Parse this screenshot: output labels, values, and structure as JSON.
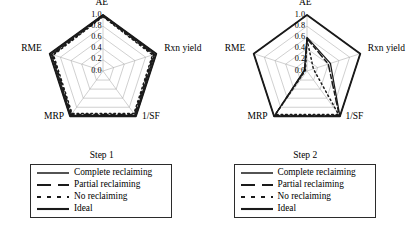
{
  "figure": {
    "panels": [
      {
        "title": "Step 1",
        "axes": [
          "AE",
          "Rxn yield",
          "1/SF",
          "MRP",
          "RME"
        ],
        "tick_labels": [
          "1.0",
          "0.8",
          "0.6",
          "0.4",
          "0.2",
          "0.0"
        ]
      },
      {
        "title": "Step 2",
        "axes": [
          "AE",
          "Rxn yield",
          "1/SF",
          "MRP",
          "RME"
        ],
        "tick_labels": [
          "1.0",
          "0.8",
          "0.6",
          "0.4",
          "0.2",
          "0.0"
        ]
      }
    ],
    "legend": {
      "entries": [
        {
          "label": "Complete reclaiming",
          "style": "solid"
        },
        {
          "label": "Partial reclaiming",
          "style": "dashed"
        },
        {
          "label": "No reclaiming",
          "style": "dotted"
        },
        {
          "label": "Ideal",
          "style": "solid-bold"
        }
      ]
    },
    "colors": {
      "line": "#1a1a1a",
      "grid": "#a8a8a8",
      "spoke": "#a8a8a8",
      "outline": "#2b2b2b",
      "background": "#ffffff"
    }
  },
  "chart_data": [
    {
      "type": "radar",
      "title": "Step 1",
      "categories": [
        "AE",
        "Rxn yield",
        "1/SF",
        "MRP",
        "RME"
      ],
      "rlim": [
        0.0,
        1.0
      ],
      "rticks": [
        0.0,
        0.2,
        0.4,
        0.6,
        0.8,
        1.0
      ],
      "grid": true,
      "legend_position": "below",
      "series": [
        {
          "name": "Complete reclaiming",
          "style": "solid",
          "values": [
            1.0,
            0.97,
            0.98,
            0.98,
            0.97
          ]
        },
        {
          "name": "Partial reclaiming",
          "style": "dashed",
          "values": [
            0.98,
            0.95,
            0.96,
            0.96,
            0.95
          ]
        },
        {
          "name": "No reclaiming",
          "style": "dotted",
          "values": [
            0.97,
            0.93,
            0.94,
            0.94,
            0.93
          ]
        },
        {
          "name": "Ideal",
          "style": "solid-bold",
          "values": [
            1.0,
            1.0,
            1.0,
            1.0,
            1.0
          ]
        }
      ]
    },
    {
      "type": "radar",
      "title": "Step 2",
      "categories": [
        "AE",
        "Rxn yield",
        "1/SF",
        "MRP",
        "RME"
      ],
      "rlim": [
        0.0,
        1.0
      ],
      "rticks": [
        0.0,
        0.2,
        0.4,
        0.6,
        0.8,
        1.0
      ],
      "grid": true,
      "legend_position": "below",
      "series": [
        {
          "name": "Complete reclaiming",
          "style": "solid",
          "values": [
            0.6,
            0.44,
            1.0,
            1.0,
            0.05
          ]
        },
        {
          "name": "Partial reclaiming",
          "style": "dashed",
          "values": [
            0.58,
            0.4,
            0.98,
            0.98,
            0.04
          ]
        },
        {
          "name": "No reclaiming",
          "style": "dotted",
          "values": [
            0.56,
            0.12,
            0.96,
            0.96,
            0.03
          ]
        },
        {
          "name": "Ideal",
          "style": "solid-bold",
          "values": [
            1.0,
            1.0,
            1.0,
            1.0,
            1.0
          ]
        }
      ]
    }
  ]
}
